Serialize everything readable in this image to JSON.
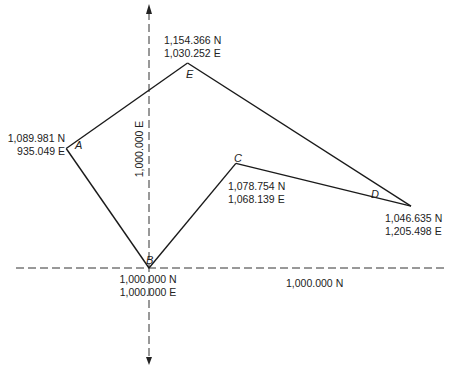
{
  "diagram": {
    "type": "traverse-plot",
    "axes": {
      "easting_reference_label": "1,000.000 E",
      "northing_reference_label": "1,000.000 N"
    },
    "points": [
      {
        "id": "A",
        "label": "A",
        "northing": "1,089.981 N",
        "easting": "935.049 E",
        "n": 1089.981,
        "e": 935.049
      },
      {
        "id": "B",
        "label": "B",
        "northing": "1,000.000 N",
        "easting": "1,000.000 E",
        "n": 1000.0,
        "e": 1000.0
      },
      {
        "id": "C",
        "label": "C",
        "northing": "1,078.754 N",
        "easting": "1,068.139 E",
        "n": 1078.754,
        "e": 1068.139
      },
      {
        "id": "D",
        "label": "D",
        "northing": "1,046.635 N",
        "easting": "1,205.498 E",
        "n": 1046.635,
        "e": 1205.498
      },
      {
        "id": "E",
        "label": "E",
        "northing": "1,154.366 N",
        "easting": "1,030.252 E",
        "n": 1154.366,
        "e": 1030.252
      }
    ],
    "traverse_order": [
      "A",
      "B",
      "C",
      "D",
      "E",
      "A"
    ]
  }
}
